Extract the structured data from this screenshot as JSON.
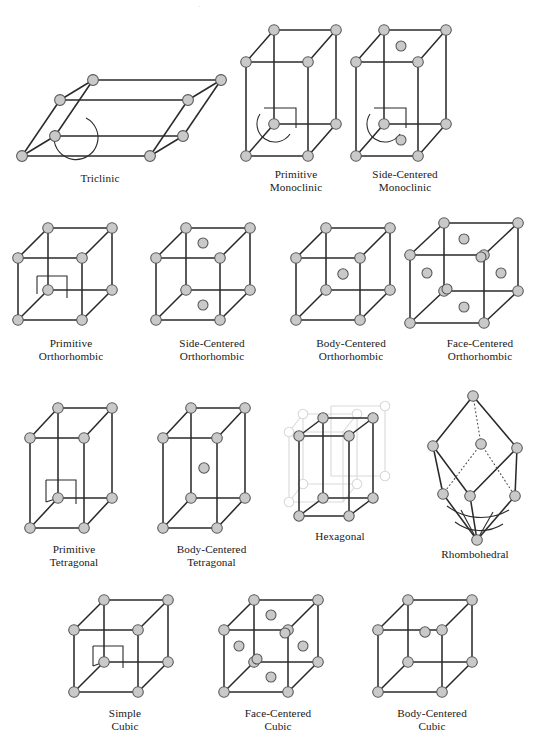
{
  "figure": {
    "title": "",
    "colors": {
      "atom_fill": "#c9c9c9",
      "atom_stroke": "#555555",
      "edge": "#2b2b2b",
      "ghost_edge": "#d9d9d9",
      "hidden_edge": "#4a4a4a",
      "background": "#ffffff",
      "text": "#181818"
    },
    "rows": [
      {
        "row": 1,
        "cells": [
          "triclinic",
          "primitive-monoclinic",
          "side-centered-monoclinic"
        ]
      },
      {
        "row": 2,
        "cells": [
          "primitive-orthorhombic",
          "side-centered-orthorhombic",
          "body-centered-orthorhombic",
          "face-centered-orthorhombic"
        ]
      },
      {
        "row": 3,
        "cells": [
          "primitive-tetragonal",
          "body-centered-tetragonal",
          "hexagonal",
          "rhombohedral"
        ]
      },
      {
        "row": 4,
        "cells": [
          "simple-cubic",
          "face-centered-cubic",
          "body-centered-cubic"
        ]
      }
    ]
  },
  "cells": {
    "triclinic": {
      "name": "triclinic",
      "label": "Triclinic",
      "lattice_points": 8,
      "interior_points": 0,
      "angle_marker": "arc",
      "shape": "oblique parallelepiped, all angles non-right"
    },
    "primitive_monoclinic": {
      "name": "primitive-monoclinic",
      "label": "Primitive\nMonoclinic",
      "label_line1": "Primitive",
      "label_line2": "Monoclinic",
      "lattice_points": 8,
      "interior_points": 0,
      "angle_marker": "arc-and-square",
      "shape": "tall prism, one oblique angle"
    },
    "side_centered_monoclinic": {
      "name": "side-centered-monoclinic",
      "label": "Side-Centered\nMonoclinic",
      "label_line1": "Side-Centered",
      "label_line2": "Monoclinic",
      "lattice_points": 8,
      "interior_points": 2,
      "centered_faces": [
        "top",
        "bottom"
      ],
      "angle_marker": "arc-and-square",
      "shape": "tall prism, one oblique angle"
    },
    "primitive_orthorhombic": {
      "name": "primitive-orthorhombic",
      "label": "Primitive\nOrthorhombic",
      "label_line1": "Primitive",
      "label_line2": "Orthorhombic",
      "lattice_points": 8,
      "interior_points": 0,
      "angle_marker": "square",
      "shape": "rectangular box a≠b≠c"
    },
    "side_centered_orthorhombic": {
      "name": "side-centered-orthorhombic",
      "label": "Side-Centered\nOrthorhombic",
      "label_line1": "Side-Centered",
      "label_line2": "Orthorhombic",
      "lattice_points": 8,
      "interior_points": 2,
      "centered_faces": [
        "top",
        "bottom"
      ],
      "angle_marker": "none",
      "shape": "rectangular box a≠b≠c"
    },
    "body_centered_orthorhombic": {
      "name": "body-centered-orthorhombic",
      "label": "Body-Centered\nOrthorhombic",
      "label_line1": "Body-Centered",
      "label_line2": "Orthorhombic",
      "lattice_points": 8,
      "interior_points": 1,
      "centered_faces": [
        "body"
      ],
      "angle_marker": "none",
      "shape": "rectangular box a≠b≠c"
    },
    "face_centered_orthorhombic": {
      "name": "face-centered-orthorhombic",
      "label": "Face-Centered\nOrthorhombic",
      "label_line1": "Face-Centered",
      "label_line2": "Orthorhombic",
      "lattice_points": 8,
      "interior_points": 6,
      "centered_faces": [
        "top",
        "bottom",
        "left",
        "right",
        "front",
        "back"
      ],
      "angle_marker": "none",
      "shape": "rectangular box a≠b≠c"
    },
    "primitive_tetragonal": {
      "name": "primitive-tetragonal",
      "label": "Primitive\nTetragonal",
      "label_line1": "Primitive",
      "label_line2": "Tetragonal",
      "lattice_points": 8,
      "interior_points": 0,
      "angle_marker": "square",
      "shape": "square prism a=b≠c"
    },
    "body_centered_tetragonal": {
      "name": "body-centered-tetragonal",
      "label": "Body-Centered\nTetragonal",
      "label_line1": "Body-Centered",
      "label_line2": "Tetragonal",
      "lattice_points": 8,
      "interior_points": 1,
      "centered_faces": [
        "body"
      ],
      "angle_marker": "none",
      "shape": "square prism a=b≠c"
    },
    "hexagonal": {
      "name": "hexagonal",
      "label": "Hexagonal",
      "label_line1": "Hexagonal",
      "label_line2": "",
      "lattice_points": 8,
      "interior_points": 0,
      "ghost_points": 8,
      "angle_marker": "none",
      "shape": "rhombic prism with ghosted neighbouring cells forming hexagon"
    },
    "rhombohedral": {
      "name": "rhombohedral",
      "label": "Rhombohedral",
      "label_line1": "Rhombohedral",
      "label_line2": "",
      "lattice_points": 8,
      "interior_points": 0,
      "angle_marker": "double-arc",
      "shape": "rhombohedron, equal edges, equal non-right angles"
    },
    "simple_cubic": {
      "name": "simple-cubic",
      "label": "Simple\nCubic",
      "label_line1": "Simple",
      "label_line2": "Cubic",
      "lattice_points": 8,
      "interior_points": 0,
      "angle_marker": "square",
      "shape": "cube a=b=c"
    },
    "face_centered_cubic": {
      "name": "face-centered-cubic",
      "label": "Face-Centered\nCubic",
      "label_line1": "Face-Centered",
      "label_line2": "Cubic",
      "lattice_points": 8,
      "interior_points": 6,
      "centered_faces": [
        "top",
        "bottom",
        "left",
        "right",
        "front",
        "back"
      ],
      "angle_marker": "none",
      "shape": "cube a=b=c"
    },
    "body_centered_cubic": {
      "name": "body-centered-cubic",
      "label": "Body-Centered\nCubic",
      "label_line1": "Body-Centered",
      "label_line2": "Cubic",
      "lattice_points": 8,
      "interior_points": 1,
      "centered_faces": [
        "body"
      ],
      "angle_marker": "none",
      "shape": "cube a=b=c"
    }
  }
}
